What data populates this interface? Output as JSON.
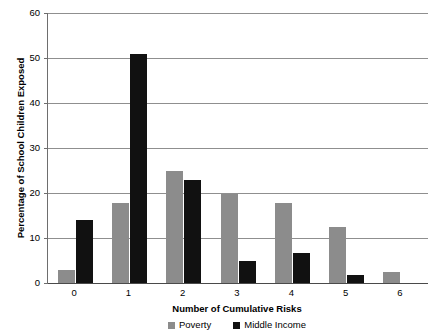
{
  "chart_data": {
    "type": "bar",
    "title": "",
    "xlabel": "Number of Cumulative Risks",
    "ylabel": "Percentage of School Children Exposed",
    "categories": [
      "0",
      "1",
      "2",
      "3",
      "4",
      "5",
      "6"
    ],
    "series": [
      {
        "name": "Poverty",
        "color": "#8c8c8c",
        "values": [
          3.0,
          17.8,
          24.8,
          19.8,
          17.8,
          12.5,
          2.5
        ]
      },
      {
        "name": "Middle Income",
        "color": "#111111",
        "values": [
          14.0,
          50.9,
          22.8,
          4.8,
          6.7,
          1.7,
          0
        ]
      }
    ],
    "ylim": [
      0,
      60
    ],
    "yticks": [
      "0",
      "10",
      "20",
      "30",
      "40",
      "50",
      "60"
    ],
    "ytick_values": [
      0,
      10,
      20,
      30,
      40,
      50,
      60
    ],
    "grid": "horizontal",
    "legend_position": "bottom"
  },
  "axes": {
    "y_title": "Percentage of School Children Exposed",
    "x_title": "Number of Cumulative Risks"
  },
  "legend": {
    "entries": [
      {
        "label": "Poverty",
        "color": "#8c8c8c"
      },
      {
        "label": "Middle Income",
        "color": "#111111"
      }
    ]
  }
}
